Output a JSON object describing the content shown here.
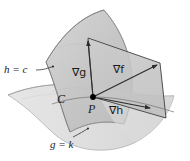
{
  "figure": {
    "background_color": "#ffffff",
    "surfaces": {
      "h_surface": {
        "label": "h = c",
        "fill_color": "#c9c9c9",
        "stroke_color": "#8a8a8a"
      },
      "g_surface": {
        "label": "g = k",
        "fill_color": "#dedede",
        "stroke_color": "#9a9a9a"
      },
      "plane": {
        "fill_color": "#c4c4c4",
        "stroke_color": "#4a4a4a"
      }
    },
    "labels": {
      "h_constraint": "h = c",
      "g_constraint": "g = k",
      "curve": "C",
      "point": "P",
      "grad_f": "∇f",
      "grad_g": "∇g",
      "grad_h": "∇h"
    },
    "point_marker": {
      "name": "P",
      "x": 93,
      "y": 97,
      "color": "#000000"
    },
    "vectors": [
      {
        "name": "∇g",
        "from_x": 93,
        "from_y": 97,
        "to_x": 88,
        "to_y": 38
      },
      {
        "name": "∇f",
        "from_x": 93,
        "from_y": 97,
        "to_x": 160,
        "to_y": 63
      },
      {
        "name": "∇h",
        "from_x": 93,
        "from_y": 97,
        "to_x": 166,
        "to_y": 118
      }
    ],
    "leader_dots": [
      {
        "name": "h-leader-dot",
        "x": 54,
        "y": 67
      },
      {
        "name": "g-leader-dot",
        "x": 88,
        "y": 128
      }
    ]
  }
}
